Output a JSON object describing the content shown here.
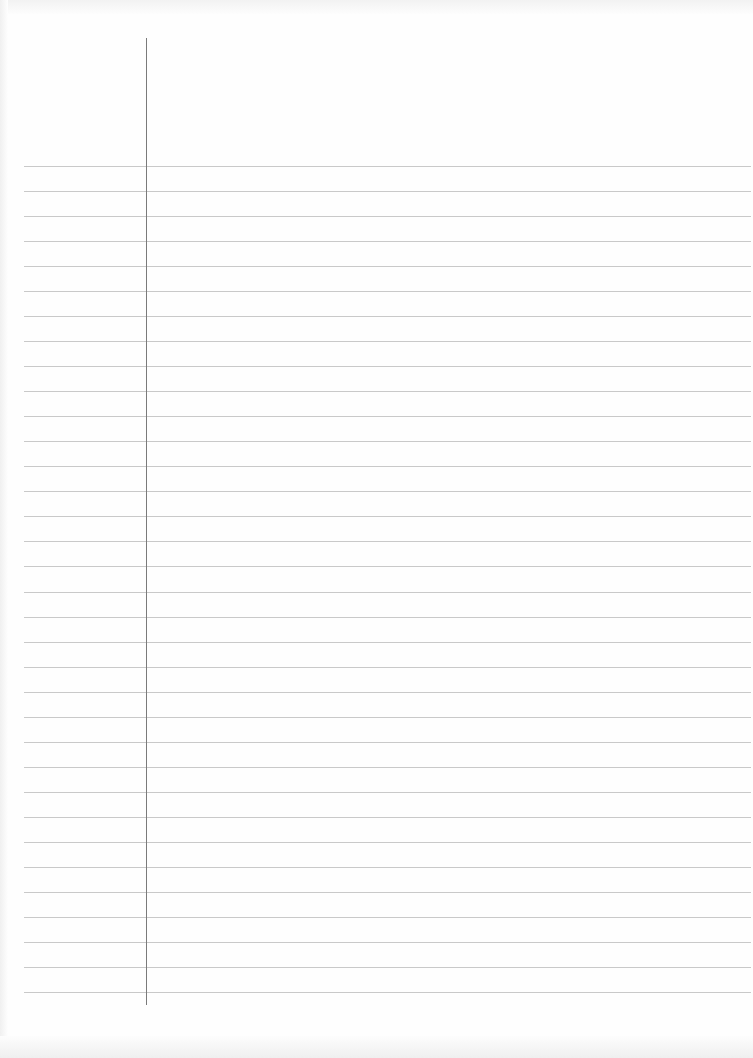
{
  "page": {
    "type": "lined-paper",
    "background_color": "#fefefe",
    "rule_color": "#c9c9c9",
    "margin_line_color": "#7a7a7a",
    "rule_count": 34,
    "first_rule_y": 166,
    "rule_spacing": 25.03,
    "margin_line_x": 146,
    "text": []
  }
}
